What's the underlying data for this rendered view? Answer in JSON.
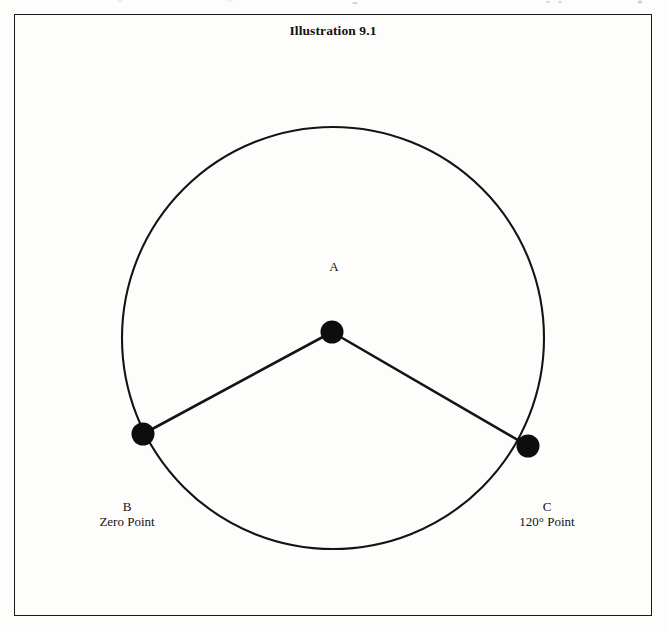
{
  "figure": {
    "title": "Illustration 9.1",
    "frame": {
      "x": 14,
      "y": 14,
      "width": 638,
      "height": 602
    }
  },
  "labels": {
    "center": {
      "letter": "A",
      "caption": ""
    },
    "left": {
      "letter": "B",
      "caption": "Zero Point"
    },
    "right": {
      "letter": "C",
      "caption": "120° Point"
    }
  },
  "colors": {
    "ink": "#121212",
    "stroke": "#1a1a1a",
    "background": "#fdfdfb"
  },
  "chart_data": {
    "type": "scatter",
    "title": "Illustration 9.1",
    "subtitle": "",
    "xlabel": "",
    "ylabel": "",
    "grid": false,
    "legend": "none",
    "circle": {
      "cx": 333,
      "cy": 338,
      "r": 211,
      "stroke_width": 2
    },
    "points": [
      {
        "name": "A",
        "role": "center",
        "x": 332,
        "y": 332,
        "dot_r": 11,
        "angle_deg": null,
        "label": "A"
      },
      {
        "name": "B",
        "role": "circumference",
        "x": 143,
        "y": 434,
        "dot_r": 11,
        "angle_deg": 0,
        "label": "B",
        "caption": "Zero Point"
      },
      {
        "name": "C",
        "role": "circumference",
        "x": 528,
        "y": 446,
        "dot_r": 11,
        "angle_deg": 120,
        "label": "C",
        "caption": "120° Point"
      }
    ],
    "segments": [
      {
        "from": "A",
        "to": "B",
        "x1": 332,
        "y1": 332,
        "x2": 143,
        "y2": 434
      },
      {
        "from": "A",
        "to": "C",
        "x1": 332,
        "y1": 332,
        "x2": 528,
        "y2": 446
      }
    ],
    "central_angle_deg": 120
  }
}
